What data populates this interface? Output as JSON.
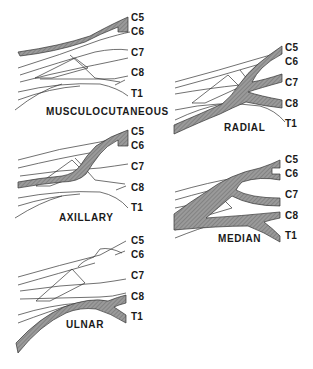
{
  "figure": {
    "root_labels": [
      "C5",
      "C6",
      "C7",
      "C8",
      "T1"
    ],
    "shade_color": "#8a8a8a",
    "line_color": "#333333"
  },
  "panels": [
    {
      "id": "musculocutaneous",
      "title": "MUSCULOCUTANEOUS",
      "highlighted_roots": [
        "C5",
        "C6"
      ],
      "roots": [
        "C5",
        "C6",
        "C7",
        "C8",
        "T1"
      ]
    },
    {
      "id": "radial",
      "title": "RADIAL",
      "highlighted_roots": [
        "C5",
        "C6",
        "C7",
        "C8"
      ],
      "roots": [
        "C5",
        "C6",
        "C7",
        "C8",
        "T1"
      ]
    },
    {
      "id": "axillary",
      "title": "AXILLARY",
      "highlighted_roots": [
        "C5",
        "C6"
      ],
      "roots": [
        "C5",
        "C6",
        "C7",
        "C8",
        "T1"
      ]
    },
    {
      "id": "median",
      "title": "MEDIAN",
      "highlighted_roots": [
        "C5",
        "C6",
        "C7",
        "C8",
        "T1"
      ],
      "roots": [
        "C5",
        "C6",
        "C7",
        "C8",
        "T1"
      ]
    },
    {
      "id": "ulnar",
      "title": "ULNAR",
      "highlighted_roots": [
        "C8",
        "T1"
      ],
      "roots": [
        "C5",
        "C6",
        "C7",
        "C8",
        "T1"
      ]
    }
  ]
}
